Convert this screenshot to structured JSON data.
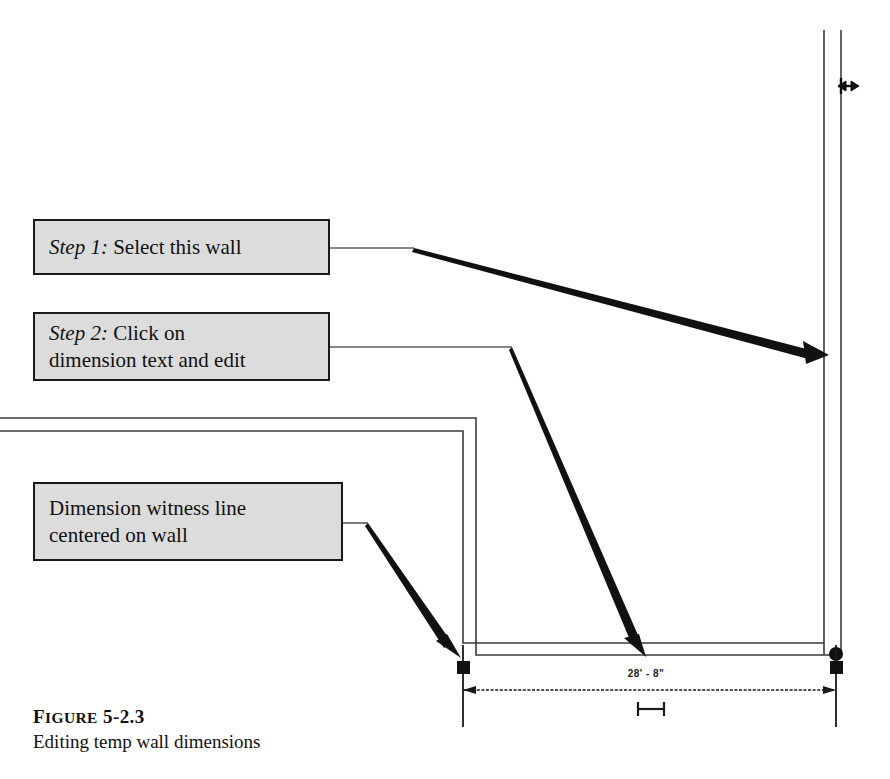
{
  "figure": {
    "caption_label_first": "F",
    "caption_label_rest": "IGURE",
    "caption_number": "5-2.3",
    "caption_text": "Editing temp wall dimensions"
  },
  "callouts": [
    {
      "id": "step1",
      "name": "callout-step-1",
      "emphasis": "Step 1:",
      "lines": [
        "Select this wall"
      ]
    },
    {
      "id": "step2",
      "name": "callout-step-2",
      "emphasis": "Step 2:",
      "lines": [
        "Click on",
        "dimension text and edit"
      ]
    },
    {
      "id": "witness",
      "name": "callout-witness-line",
      "emphasis": "",
      "lines": [
        "Dimension witness line",
        "centered on wall"
      ]
    }
  ],
  "drawing": {
    "dimension_text": "28' - 8\"",
    "wall_color": "#3a3a3a",
    "annotation_color": "#111111",
    "callout_fill": "#dcdcdc",
    "callout_border": "#1a1a1a",
    "marker_node": "round-node",
    "witness_markers": [
      "square-marker-left",
      "square-marker-right"
    ],
    "grip_handle": "horizontal-drag-grip",
    "wall_grip": "bidirectional-arrow-grip"
  }
}
